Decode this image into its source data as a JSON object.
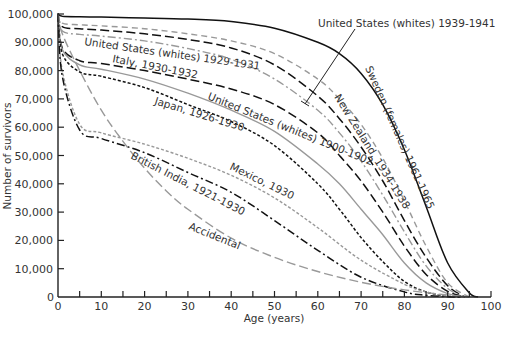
{
  "chart_data": {
    "type": "line",
    "title": "",
    "xlabel": "Age (years)",
    "ylabel": "Number of survivors",
    "xlim": [
      0,
      100
    ],
    "ylim": [
      0,
      100000
    ],
    "x_ticks": [
      0,
      10,
      20,
      30,
      40,
      50,
      60,
      70,
      80,
      90,
      100
    ],
    "x_minor_ticks": [
      5,
      15,
      25,
      35,
      45,
      55,
      65,
      75,
      85,
      95
    ],
    "y_ticks": [
      0,
      10000,
      20000,
      30000,
      40000,
      50000,
      60000,
      70000,
      80000,
      90000,
      100000
    ],
    "y_tick_labels": [
      "0",
      "10,000",
      "20,000",
      "30,000",
      "40,000",
      "50,000",
      "60,000",
      "70,000",
      "80,000",
      "90,000",
      "100,000"
    ],
    "x_tick_labels": [
      "0",
      "10",
      "20",
      "30",
      "40",
      "50",
      "60",
      "70",
      "80",
      "90",
      "100"
    ],
    "grid": false,
    "legend": "inline labels",
    "series": [
      {
        "name": "Sweden (females) 1961-1965",
        "style": "solid",
        "color": "#111111",
        "x": [
          0,
          1,
          5,
          10,
          20,
          30,
          40,
          50,
          60,
          65,
          70,
          75,
          80,
          85,
          90,
          95,
          97
        ],
        "y": [
          100000,
          99200,
          99000,
          98900,
          98600,
          98200,
          97300,
          95000,
          90000,
          86000,
          79000,
          68000,
          52000,
          32000,
          12000,
          1500,
          0
        ]
      },
      {
        "name": "United States (whites) 1939-1941",
        "style": "long-dash",
        "color": "#111111",
        "x": [
          0,
          1,
          5,
          10,
          20,
          30,
          40,
          50,
          60,
          65,
          70,
          75,
          80,
          85,
          90,
          94
        ],
        "y": [
          100000,
          95500,
          94800,
          94300,
          93000,
          91000,
          88000,
          82000,
          71000,
          63000,
          53000,
          41000,
          27000,
          14000,
          4000,
          0
        ]
      },
      {
        "name": "New Zealand, 1934-1938",
        "style": "dash",
        "color": "#999999",
        "x": [
          0,
          1,
          5,
          10,
          20,
          30,
          40,
          50,
          60,
          65,
          70,
          75,
          80,
          85,
          90,
          95
        ],
        "y": [
          100000,
          96800,
          96200,
          95800,
          94800,
          93000,
          90500,
          86000,
          77000,
          70000,
          61000,
          49000,
          34000,
          18000,
          5000,
          0
        ]
      },
      {
        "name": "United States (whites) 1929-1931",
        "style": "dash-dot",
        "color": "#999999",
        "x": [
          0,
          1,
          5,
          10,
          20,
          30,
          40,
          50,
          60,
          65,
          70,
          75,
          80,
          85,
          90,
          94
        ],
        "y": [
          100000,
          94000,
          92800,
          92200,
          90500,
          87800,
          84000,
          77000,
          66000,
          58000,
          48000,
          36000,
          23000,
          11000,
          3000,
          0
        ]
      },
      {
        "name": "Italy, 1930-1932",
        "style": "long-dash",
        "color": "#111111",
        "x": [
          0,
          1,
          5,
          10,
          20,
          30,
          40,
          50,
          60,
          65,
          70,
          75,
          80,
          85,
          90,
          94
        ],
        "y": [
          100000,
          88000,
          83500,
          82500,
          80000,
          77000,
          73500,
          68000,
          58000,
          50000,
          41000,
          30000,
          18000,
          8000,
          2000,
          0
        ]
      },
      {
        "name": "United States (whites) 1900-1902",
        "style": "solid",
        "color": "#999999",
        "x": [
          0,
          1,
          5,
          10,
          20,
          30,
          40,
          50,
          60,
          65,
          70,
          75,
          80,
          85,
          90,
          94
        ],
        "y": [
          100000,
          87500,
          82000,
          80500,
          77000,
          72000,
          66000,
          58500,
          47000,
          40000,
          31000,
          22000,
          12000,
          5000,
          1200,
          0
        ]
      },
      {
        "name": "Japan, 1926-1930",
        "style": "short-dash",
        "color": "#111111",
        "x": [
          0,
          1,
          5,
          10,
          20,
          30,
          40,
          50,
          60,
          65,
          70,
          75,
          80,
          85,
          90,
          93
        ],
        "y": [
          100000,
          86000,
          79500,
          78000,
          74000,
          68000,
          62000,
          53500,
          40000,
          31000,
          21000,
          12500,
          5500,
          1800,
          300,
          0
        ]
      },
      {
        "name": "Mexico, 1930",
        "style": "short-dash",
        "color": "#999999",
        "x": [
          0,
          1,
          5,
          10,
          20,
          30,
          40,
          50,
          60,
          70,
          80,
          85,
          90,
          93
        ],
        "y": [
          100000,
          80000,
          61000,
          58000,
          54000,
          49000,
          43000,
          35000,
          24500,
          13000,
          4500,
          1800,
          400,
          0
        ]
      },
      {
        "name": "British India, 1921-1930",
        "style": "dash-dot",
        "color": "#111111",
        "x": [
          0,
          1,
          5,
          10,
          20,
          30,
          40,
          50,
          60,
          70,
          80,
          85,
          90,
          93
        ],
        "y": [
          100000,
          78000,
          59000,
          56000,
          51000,
          44000,
          37000,
          27000,
          16500,
          7000,
          1800,
          600,
          100,
          0
        ]
      },
      {
        "name": "Accidental",
        "style": "long-dash",
        "color": "#999999",
        "x": [
          0,
          1,
          5,
          10,
          15,
          20,
          25,
          30,
          40,
          50,
          60,
          70,
          80,
          90,
          95
        ],
        "y": [
          100000,
          93000,
          80000,
          66000,
          55000,
          45500,
          37500,
          31000,
          20800,
          14000,
          9000,
          5200,
          2500,
          700,
          0
        ]
      }
    ],
    "annotations": [
      {
        "text": "United States (whites) 1939-1941",
        "type": "callout with leader line"
      },
      {
        "text": "Sweden (females) 1961-1965"
      },
      {
        "text": "New Zealand, 1934-1938"
      },
      {
        "text": "United States (whites) 1929-1931"
      },
      {
        "text": "Italy, 1930-1932"
      },
      {
        "text": "United States (whites) 1900-1902"
      },
      {
        "text": "Japan, 1926-1930"
      },
      {
        "text": "Mexico, 1930"
      },
      {
        "text": "British India, 1921-1930"
      },
      {
        "text": "Accidental"
      }
    ]
  },
  "labels": {
    "xlabel": "Age (years)",
    "ylabel": "Number of survivors",
    "us_1939": "United States (whites) 1939-1941",
    "sweden": "Sweden (females) 1961-1965",
    "new_zealand": "New Zealand, 1934-1938",
    "us_1929": "United States (whites) 1929-1931",
    "italy": "Italy, 1930-1932",
    "us_1900": "United States (whites) 1900-1902",
    "japan": "Japan, 1926-1930",
    "mexico": "Mexico, 1930",
    "india": "British India, 1921-1930",
    "accidental": "Accidental"
  }
}
